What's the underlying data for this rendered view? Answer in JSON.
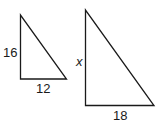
{
  "figure": {
    "triangles": [
      {
        "name": "small",
        "vertical_leg_label": "16",
        "base_label": "12"
      },
      {
        "name": "large",
        "vertical_leg_label": "x",
        "base_label": "18"
      }
    ],
    "stroke_color": "#1a1a1a",
    "background": "#ffffff"
  }
}
